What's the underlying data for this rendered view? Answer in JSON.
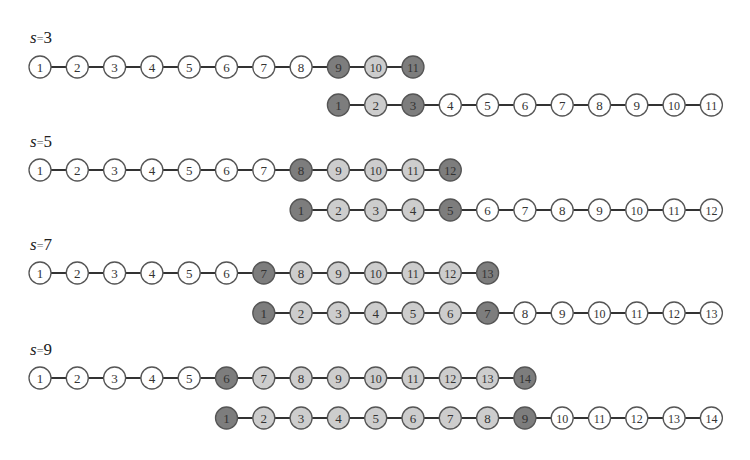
{
  "figure": {
    "node_spacing": 37.3,
    "node_radius": 11,
    "start_x": 40,
    "colors": {
      "dark": "#7d7d7d",
      "light": "#cdcdcd",
      "white": "#ffffff",
      "stroke": "#555555",
      "edge": "#333333"
    },
    "panels": [
      {
        "label": "s=3",
        "label_var": "s",
        "label_val": "3",
        "label_y": 28,
        "rows": [
          {
            "y": 67,
            "offset": 0,
            "nodes": [
              1,
              2,
              3,
              4,
              5,
              6,
              7,
              8,
              9,
              10,
              11
            ],
            "fills": [
              "w",
              "w",
              "w",
              "w",
              "w",
              "w",
              "w",
              "w",
              "d",
              "l",
              "d"
            ]
          },
          {
            "y": 105,
            "offset": 8,
            "nodes": [
              1,
              2,
              3,
              4,
              5,
              6,
              7,
              8,
              9,
              10,
              11
            ],
            "fills": [
              "d",
              "l",
              "d",
              "w",
              "w",
              "w",
              "w",
              "w",
              "w",
              "w",
              "w"
            ]
          }
        ]
      },
      {
        "label": "s=5",
        "label_var": "s",
        "label_val": "5",
        "label_y": 132,
        "rows": [
          {
            "y": 170,
            "offset": 0,
            "nodes": [
              1,
              2,
              3,
              4,
              5,
              6,
              7,
              8,
              9,
              10,
              11,
              12
            ],
            "fills": [
              "w",
              "w",
              "w",
              "w",
              "w",
              "w",
              "w",
              "d",
              "l",
              "l",
              "l",
              "d"
            ]
          },
          {
            "y": 210,
            "offset": 7,
            "nodes": [
              1,
              2,
              3,
              4,
              5,
              6,
              7,
              8,
              9,
              10,
              11,
              12
            ],
            "fills": [
              "d",
              "l",
              "l",
              "l",
              "d",
              "w",
              "w",
              "w",
              "w",
              "w",
              "w",
              "w"
            ]
          }
        ]
      },
      {
        "label": "s=7",
        "label_var": "s",
        "label_val": "7",
        "label_y": 235,
        "rows": [
          {
            "y": 273,
            "offset": 0,
            "nodes": [
              1,
              2,
              3,
              4,
              5,
              6,
              7,
              8,
              9,
              10,
              11,
              12,
              13
            ],
            "fills": [
              "w",
              "w",
              "w",
              "w",
              "w",
              "w",
              "d",
              "l",
              "l",
              "l",
              "l",
              "l",
              "d"
            ]
          },
          {
            "y": 313,
            "offset": 6,
            "nodes": [
              1,
              2,
              3,
              4,
              5,
              6,
              7,
              8,
              9,
              10,
              11,
              12,
              13
            ],
            "fills": [
              "d",
              "l",
              "l",
              "l",
              "l",
              "l",
              "d",
              "w",
              "w",
              "w",
              "w",
              "w",
              "w"
            ]
          }
        ]
      },
      {
        "label": "s=9",
        "label_var": "s",
        "label_val": "9",
        "label_y": 340,
        "rows": [
          {
            "y": 378,
            "offset": 0,
            "nodes": [
              1,
              2,
              3,
              4,
              5,
              6,
              7,
              8,
              9,
              10,
              11,
              12,
              13,
              14
            ],
            "fills": [
              "w",
              "w",
              "w",
              "w",
              "w",
              "d",
              "l",
              "l",
              "l",
              "l",
              "l",
              "l",
              "l",
              "d"
            ]
          },
          {
            "y": 418,
            "offset": 5,
            "nodes": [
              1,
              2,
              3,
              4,
              5,
              6,
              7,
              8,
              9,
              10,
              11,
              12,
              13,
              14
            ],
            "fills": [
              "d",
              "l",
              "l",
              "l",
              "l",
              "l",
              "l",
              "l",
              "d",
              "w",
              "w",
              "w",
              "w",
              "w"
            ]
          }
        ]
      }
    ]
  }
}
